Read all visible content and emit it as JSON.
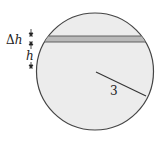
{
  "diagram": {
    "title": "",
    "labels": {
      "delta_h": "Δh",
      "h": "h",
      "radius": "3"
    },
    "circle": {
      "cx": 95,
      "cy": 71.5,
      "r": 58.5,
      "fill": "#ececec",
      "stroke": "#444444"
    },
    "band": {
      "y_top": 36,
      "y_bottom": 42,
      "fill": "#b9b9b9",
      "stroke": "#555555"
    },
    "radius_line": {
      "x1": 96,
      "y1": 72,
      "x2": 146,
      "y2": 96
    },
    "colors": {
      "background": "#ffffff",
      "ink": "#222222"
    }
  }
}
